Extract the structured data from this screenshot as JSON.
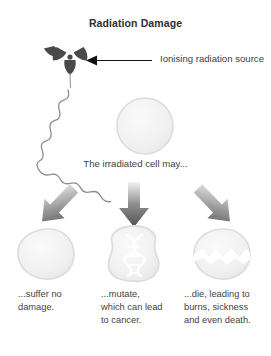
{
  "title": "Radiation Damage",
  "source_label": "Ionising radiation source",
  "mid_caption": "The irradiated cell may...",
  "icons": {
    "radiation_trefoil": "radiation-trefoil-icon",
    "pointer_arrow": "pointer-arrow-icon",
    "wave": "radiation-wave-icon",
    "cell": "cell-icon",
    "dna": "dna-helix-icon",
    "crack": "cell-crack-icon",
    "down_arrow": "down-arrow-icon"
  },
  "colors": {
    "trefoil": "#4a4a4a",
    "arrow_line": "#111111",
    "wave": "#8c8c8c",
    "cell_fill": "#f2f2f2",
    "cell_stroke": "#d8d8d8",
    "arrow_dark": "#5a5a5a",
    "arrow_light": "#f4f4f4",
    "text": "#3f3f3f",
    "title": "#2f2f2f",
    "background": "#ffffff"
  },
  "outcomes": [
    {
      "id": "no-damage",
      "caption": "...suffer no damage.",
      "cell_state": "intact"
    },
    {
      "id": "mutate",
      "caption": "...mutate, which can lead to cancer.",
      "cell_state": "mutated"
    },
    {
      "id": "die",
      "caption": "...die, leading to burns, sickness and even death.",
      "cell_state": "dying"
    }
  ]
}
